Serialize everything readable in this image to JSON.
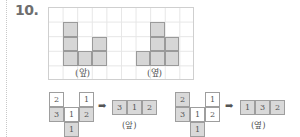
{
  "question": {
    "number": "10."
  },
  "top_figure": {
    "front": {
      "label": "(앞)",
      "columns": [
        3,
        1,
        2
      ]
    },
    "side": {
      "label": "(옆)",
      "columns": [
        1,
        3,
        2
      ]
    }
  },
  "nets": [
    {
      "cells": [
        {
          "r": 0,
          "c": 0,
          "v": "2",
          "gray": false
        },
        {
          "r": 0,
          "c": 2,
          "v": "1",
          "gray": false
        },
        {
          "r": 1,
          "c": 0,
          "v": "3",
          "gray": true
        },
        {
          "r": 1,
          "c": 1,
          "v": "1",
          "gray": false
        },
        {
          "r": 1,
          "c": 2,
          "v": "2",
          "gray": true
        },
        {
          "r": 2,
          "c": 1,
          "v": "1",
          "gray": true
        }
      ],
      "arrow": "➡",
      "result": [
        "3",
        "1",
        "2"
      ],
      "result_label": "(앞)"
    },
    {
      "cells": [
        {
          "r": 0,
          "c": 0,
          "v": "2",
          "gray": true
        },
        {
          "r": 0,
          "c": 2,
          "v": "1",
          "gray": false
        },
        {
          "r": 1,
          "c": 0,
          "v": "3",
          "gray": true
        },
        {
          "r": 1,
          "c": 1,
          "v": "1",
          "gray": false
        },
        {
          "r": 1,
          "c": 2,
          "v": "2",
          "gray": false
        },
        {
          "r": 2,
          "c": 1,
          "v": "1",
          "gray": true
        }
      ],
      "arrow": "➡",
      "result": [
        "1",
        "3",
        "2"
      ],
      "result_label": "(옆)"
    }
  ]
}
